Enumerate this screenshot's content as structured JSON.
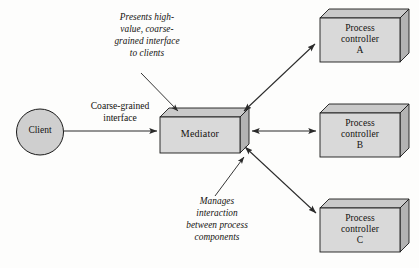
{
  "diagram": {
    "colors": {
      "box_face": "#d9d9d9",
      "box_top": "#c8c8c8",
      "box_side": "#b4b4b4",
      "stroke": "#1a1a1a",
      "arrow": "#2a2a2a",
      "background": "#fdfdfc",
      "text": "#14120f"
    },
    "nodes": [
      {
        "id": "client",
        "shape": "ellipse",
        "label": "Client",
        "x": 40,
        "y": 132,
        "rx": 24,
        "ry": 23
      },
      {
        "id": "mediator",
        "shape": "box3d",
        "label": "Mediator",
        "x": 160,
        "y": 117,
        "width": 80,
        "height": 36,
        "depth": 9
      },
      {
        "id": "controller_a",
        "shape": "box3d",
        "label": "Process\ncontroller\nA",
        "x": 320,
        "y": 18,
        "width": 80,
        "height": 44,
        "depth": 9
      },
      {
        "id": "controller_b",
        "shape": "box3d",
        "label": "Process\ncontroller\nB",
        "x": 320,
        "y": 113,
        "width": 80,
        "height": 44,
        "depth": 9
      },
      {
        "id": "controller_c",
        "shape": "box3d",
        "label": "Process\ncontroller\nC",
        "x": 320,
        "y": 208,
        "width": 80,
        "height": 44,
        "depth": 9
      }
    ],
    "edges": [
      {
        "id": "client-to-mediator",
        "from": "client",
        "to": "mediator",
        "arrow": "single",
        "label": "Coarse-grained\ninterface"
      },
      {
        "id": "mediator-to-controller-a",
        "from": "mediator",
        "to": "controller_a",
        "arrow": "double",
        "label": ""
      },
      {
        "id": "mediator-to-controller-b",
        "from": "mediator",
        "to": "controller_b",
        "arrow": "double",
        "label": ""
      },
      {
        "id": "mediator-to-controller-c",
        "from": "mediator",
        "to": "controller_c",
        "arrow": "double",
        "label": ""
      }
    ],
    "annotations": [
      {
        "id": "presents-interface-note",
        "text": "Presents high-\nvalue, coarse-\ngrained interface\nto clients",
        "target": "mediator",
        "leader": "from-upper-left"
      },
      {
        "id": "manages-interaction-note",
        "text": "Manages\ninteraction\nbetween process\ncomponents",
        "target": "mediator",
        "leader": "from-lower-right"
      }
    ]
  }
}
